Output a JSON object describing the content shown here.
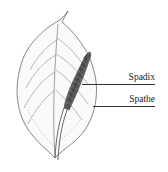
{
  "diagram": {
    "labels": [
      {
        "id": "spadix",
        "text": "Spadix"
      },
      {
        "id": "spathe",
        "text": "Spathe"
      }
    ],
    "colors": {
      "ink": "#333333",
      "background": "#ffffff"
    }
  }
}
